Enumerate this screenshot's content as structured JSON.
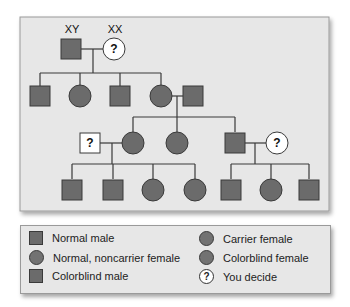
{
  "pedigree": {
    "generation1": {
      "father": {
        "label": "XY",
        "sex": "male",
        "status": "colorblind male"
      },
      "mother": {
        "label": "XX",
        "sex": "female",
        "status": "you decide",
        "mark": "?"
      }
    },
    "generation2": [
      {
        "sex": "male",
        "status": "colorblind male"
      },
      {
        "sex": "female",
        "status": "carrier female"
      },
      {
        "sex": "male",
        "status": "colorblind male"
      },
      {
        "sex": "female",
        "status": "carrier female",
        "spouse": {
          "sex": "male",
          "status": "colorblind male"
        }
      }
    ],
    "generation3": [
      {
        "sex": "female",
        "status": "carrier female",
        "spouse": {
          "sex": "male",
          "status": "you decide",
          "mark": "?"
        }
      },
      {
        "sex": "female",
        "status": "carrier female"
      },
      {
        "sex": "male",
        "status": "colorblind male",
        "spouse": {
          "sex": "female",
          "status": "you decide",
          "mark": "?"
        }
      }
    ],
    "generation4": [
      {
        "sex": "male",
        "status": "colorblind male"
      },
      {
        "sex": "male",
        "status": "colorblind male"
      },
      {
        "sex": "female",
        "status": "carrier female"
      },
      {
        "sex": "female",
        "status": "carrier female"
      },
      {
        "sex": "male",
        "status": "colorblind male"
      },
      {
        "sex": "female",
        "status": "colorblind female"
      },
      {
        "sex": "male",
        "status": "colorblind male"
      }
    ]
  },
  "legend": {
    "items": [
      {
        "label": "Normal male",
        "symbol": "square"
      },
      {
        "label": "Normal, noncarrier female",
        "symbol": "circle"
      },
      {
        "label": "Colorblind male",
        "symbol": "square"
      },
      {
        "label": "Carrier female",
        "symbol": "circle"
      },
      {
        "label": "Colorblind female",
        "symbol": "circle"
      },
      {
        "label": "You decide",
        "symbol": "question",
        "mark": "?"
      }
    ]
  },
  "colors": {
    "panel": "#e7e7e7",
    "shape_fill": "#6b6b6b",
    "line": "#3a3a3a",
    "unknown_fill": "#ffffff"
  }
}
